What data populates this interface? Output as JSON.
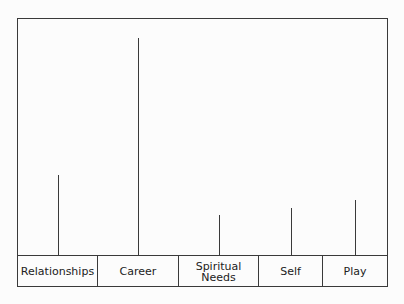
{
  "chart_data": {
    "type": "bar",
    "title": "",
    "xlabel": "",
    "ylabel": "",
    "categories": [
      "Relationships",
      "Career",
      "Spiritual Needs",
      "Self",
      "Play"
    ],
    "values": [
      80,
      217,
      40,
      47,
      55
    ],
    "ylim": [
      0,
      236
    ],
    "grid": false,
    "legend": null
  },
  "labels": {
    "relationships": "Relationships",
    "career": "Career",
    "spiritual_1": "Spiritual",
    "spiritual_2": "Needs",
    "self": "Self",
    "play": "Play"
  }
}
